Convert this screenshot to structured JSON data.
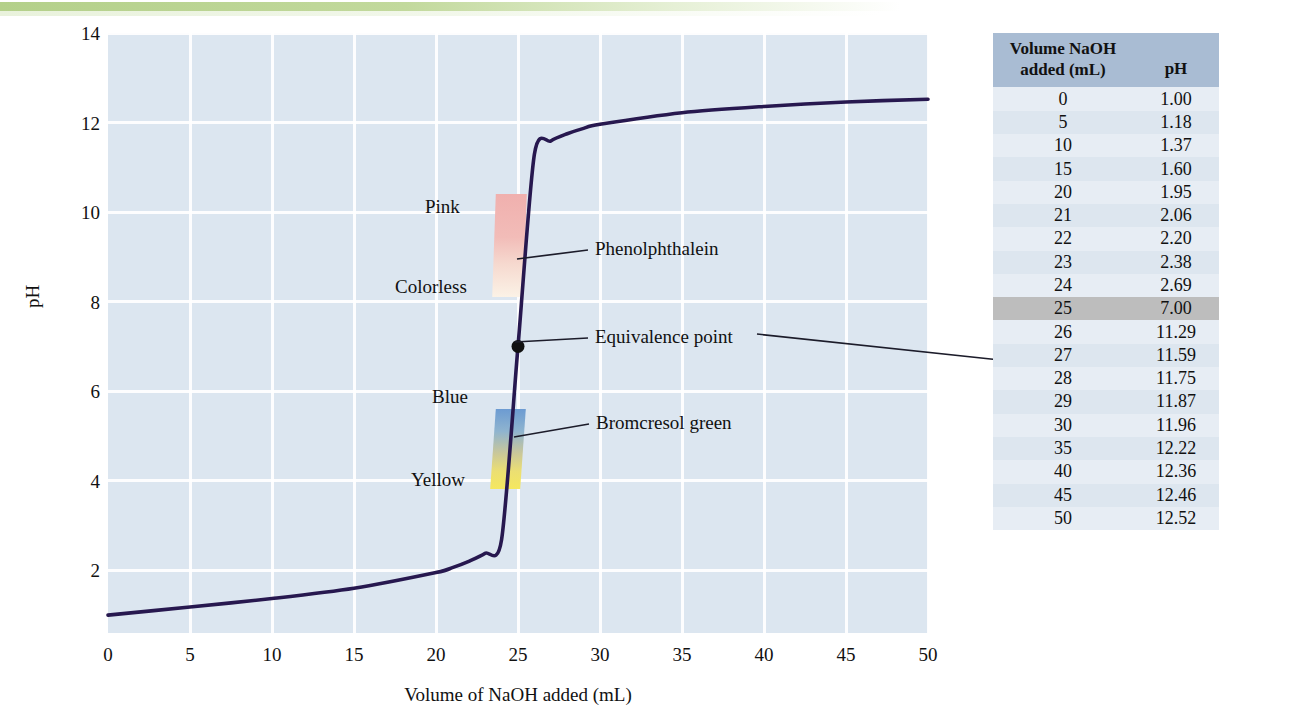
{
  "chart_data": {
    "type": "line",
    "title": "",
    "xlabel": "Volume of NaOH added (mL)",
    "ylabel": "pH",
    "xlim": [
      0,
      50
    ],
    "ylim": [
      0.6,
      14
    ],
    "xticks": [
      0,
      5,
      10,
      15,
      20,
      25,
      30,
      35,
      40,
      45,
      50
    ],
    "yticks": [
      2,
      4,
      6,
      8,
      10,
      12,
      14
    ],
    "grid": true,
    "legend": "none",
    "series": [
      {
        "name": "Titration of strong acid with NaOH",
        "color": "#27184f",
        "x": [
          0,
          5,
          10,
          15,
          20,
          21,
          22,
          23,
          24,
          25,
          26,
          27,
          28,
          29,
          30,
          35,
          40,
          45,
          50
        ],
        "y": [
          1.0,
          1.18,
          1.37,
          1.6,
          1.95,
          2.06,
          2.2,
          2.38,
          2.69,
          7.0,
          11.29,
          11.59,
          11.75,
          11.87,
          11.96,
          12.22,
          12.36,
          12.46,
          12.52
        ]
      }
    ],
    "annotations": [
      {
        "name": "equivalence-point",
        "label": "Equivalence point",
        "x": 25,
        "y": 7.0,
        "marker": "dot"
      },
      {
        "name": "phenolphthalein",
        "label": "Phenolphthalein",
        "range_ph": [
          8.3,
          10.0
        ],
        "colors": [
          "Colorless",
          "Pink"
        ]
      },
      {
        "name": "bromcresol-green",
        "label": "Bromcresol green",
        "range_ph": [
          3.8,
          5.4
        ],
        "colors": [
          "Yellow",
          "Blue"
        ]
      }
    ]
  },
  "axes": {
    "y_title": "pH",
    "x_title": "Volume of NaOH added (mL)",
    "y_ticks": [
      "14",
      "12",
      "10",
      "8",
      "6",
      "4",
      "2"
    ],
    "x_ticks": [
      "0",
      "5",
      "10",
      "15",
      "20",
      "25",
      "30",
      "35",
      "40",
      "45",
      "50"
    ]
  },
  "indicators": {
    "phenolphthalein": {
      "callout": "Phenolphthalein",
      "upper_color_label": "Pink",
      "lower_color_label": "Colorless"
    },
    "bromcresol": {
      "callout": "Bromcresol green",
      "upper_color_label": "Blue",
      "lower_color_label": "Yellow"
    },
    "equivalence": {
      "callout": "Equivalence point"
    }
  },
  "table": {
    "headers": {
      "volume_line1": "Volume NaOH",
      "volume_line2": "added (mL)",
      "ph": "pH"
    },
    "rows": [
      {
        "volume": "0",
        "ph": "1.00",
        "highlight": false
      },
      {
        "volume": "5",
        "ph": "1.18",
        "highlight": false
      },
      {
        "volume": "10",
        "ph": "1.37",
        "highlight": false
      },
      {
        "volume": "15",
        "ph": "1.60",
        "highlight": false
      },
      {
        "volume": "20",
        "ph": "1.95",
        "highlight": false
      },
      {
        "volume": "21",
        "ph": "2.06",
        "highlight": false
      },
      {
        "volume": "22",
        "ph": "2.20",
        "highlight": false
      },
      {
        "volume": "23",
        "ph": "2.38",
        "highlight": false
      },
      {
        "volume": "24",
        "ph": "2.69",
        "highlight": false
      },
      {
        "volume": "25",
        "ph": "7.00",
        "highlight": true
      },
      {
        "volume": "26",
        "ph": "11.29",
        "highlight": false
      },
      {
        "volume": "27",
        "ph": "11.59",
        "highlight": false
      },
      {
        "volume": "28",
        "ph": "11.75",
        "highlight": false
      },
      {
        "volume": "29",
        "ph": "11.87",
        "highlight": false
      },
      {
        "volume": "30",
        "ph": "11.96",
        "highlight": false
      },
      {
        "volume": "35",
        "ph": "12.22",
        "highlight": false
      },
      {
        "volume": "40",
        "ph": "12.36",
        "highlight": false
      },
      {
        "volume": "45",
        "ph": "12.46",
        "highlight": false
      },
      {
        "volume": "50",
        "ph": "12.52",
        "highlight": false
      }
    ]
  },
  "colors": {
    "plot_background": "#dce6f0",
    "grid": "#ffffff",
    "curve": "#27184f",
    "table_header": "#a9bcd3",
    "table_row": "#e7edf4",
    "table_highlight": "#bdbdbd",
    "top_band": "#b4d08a",
    "pink_band": "#f0b0ae",
    "blue_band": "#6c9bd2",
    "yellow_band": "#f5e85f"
  }
}
